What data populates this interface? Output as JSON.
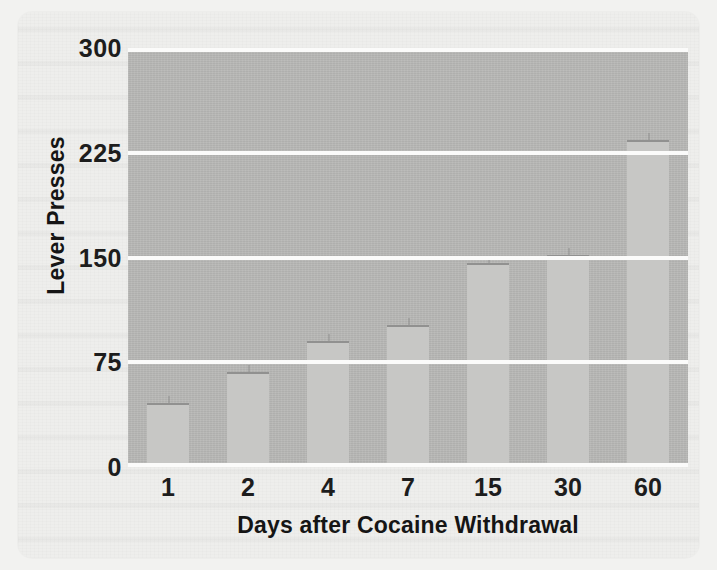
{
  "figure": {
    "caption_visible": false,
    "background_color": "#eeeeec",
    "plot_background_color": "#b9b9b7",
    "bar_color": "#c7c7c5",
    "gridline_color": "#fbfbfa",
    "text_color": "#1d1d1d"
  },
  "chart_data": {
    "type": "bar",
    "title": "",
    "xlabel": "Days after Cocaine Withdrawal",
    "ylabel": "Lever Presses",
    "categories": [
      "1",
      "2",
      "4",
      "7",
      "15",
      "30",
      "60"
    ],
    "values": [
      46,
      68,
      90,
      102,
      146,
      152,
      234
    ],
    "ylim": [
      0,
      300
    ],
    "yticks": [
      "0",
      "75",
      "150",
      "225",
      "300"
    ],
    "ytick_values": [
      0,
      75,
      150,
      225,
      300
    ],
    "grid": true,
    "grid_axis": "y",
    "legend": "none",
    "series": [
      {
        "name": "Lever Presses",
        "values": [
          46,
          68,
          90,
          102,
          146,
          152,
          234
        ]
      }
    ]
  }
}
